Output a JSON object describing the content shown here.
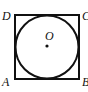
{
  "diagram": {
    "shapes": {
      "square": {
        "vertices": [
          "A",
          "B",
          "C",
          "D"
        ]
      },
      "circle": {
        "center": "O",
        "inscribed_in": "square ABCD"
      }
    },
    "labels": {
      "D": "D",
      "C": "C",
      "A": "A",
      "B": "B",
      "O": "O"
    },
    "colors": {
      "stroke": "#111111",
      "background": "#ffffff"
    }
  }
}
